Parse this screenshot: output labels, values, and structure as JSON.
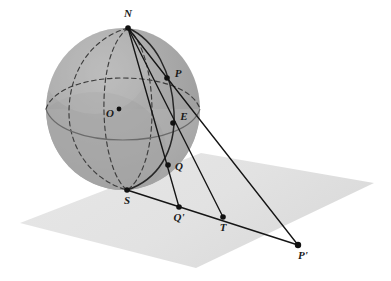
{
  "figure": {
    "name": "stereographic-projection-diagram",
    "title": "",
    "background_color": "#ffffff"
  },
  "colors": {
    "sphere_fill": "#a9a9a9",
    "sphere_lower_band": "#b4b4b4",
    "sphere_shadow": "#9a9a9a",
    "sphere_highlight": "#b8b8b8",
    "plane_fill": "#e5e5e5",
    "plane_fill_dark": "#dcdcdc",
    "line_color": "#1a1a1a",
    "curve_color": "#2b2b2b",
    "dashed_color": "#3a3a3a",
    "label_color": "#1a1a1a",
    "point_color": "#111111"
  },
  "points": [
    {
      "id": "N",
      "label": "N",
      "x": 128,
      "y": 28,
      "label_x": 128,
      "label_y": 14,
      "on": "sphere-north-pole"
    },
    {
      "id": "P",
      "label": "P",
      "x": 167,
      "y": 78,
      "label_x": 178,
      "label_y": 74,
      "on": "sphere"
    },
    {
      "id": "O",
      "label": "O",
      "x": 119,
      "y": 109,
      "label_x": 110,
      "label_y": 114,
      "on": "sphere-center"
    },
    {
      "id": "E",
      "label": "E",
      "x": 173,
      "y": 123,
      "label_x": 184,
      "label_y": 117,
      "on": "sphere-equator"
    },
    {
      "id": "Q",
      "label": "Q",
      "x": 168,
      "y": 165,
      "label_x": 179,
      "label_y": 167,
      "on": "sphere"
    },
    {
      "id": "S",
      "label": "S",
      "x": 127,
      "y": 190,
      "label_x": 127,
      "label_y": 201,
      "on": "sphere-south-pole"
    },
    {
      "id": "Qp",
      "label": "Q'",
      "x": 179,
      "y": 207,
      "label_x": 179,
      "label_y": 218,
      "on": "plane"
    },
    {
      "id": "T",
      "label": "T",
      "x": 223,
      "y": 217,
      "label_x": 223,
      "label_y": 228,
      "on": "plane"
    },
    {
      "id": "Pp",
      "label": "P'",
      "x": 298,
      "y": 245,
      "label_x": 303,
      "label_y": 256,
      "on": "plane"
    }
  ],
  "sphere": {
    "center_x": 123,
    "center_y": 109,
    "radius_x": 77,
    "radius_y": 81
  },
  "plane": {
    "corners": [
      {
        "x": 20,
        "y": 223
      },
      {
        "x": 201,
        "y": 153
      },
      {
        "x": 374,
        "y": 183
      },
      {
        "x": 196,
        "y": 268
      }
    ]
  },
  "segments": [
    {
      "id": "N-P-Pprime",
      "from": "N",
      "to": "P'",
      "style": "solid",
      "description": "projection ray from north pole through P to P-prime"
    },
    {
      "id": "N-Q-Qprime",
      "from": "N",
      "to": "Q'",
      "style": "solid",
      "description": "projection ray from north pole through Q to Q-prime"
    },
    {
      "id": "N-E-T",
      "from": "N",
      "to": "T",
      "style": "solid",
      "description": "projection ray from north pole through E to T"
    },
    {
      "id": "S-Pprime",
      "from": "S",
      "to": "P'",
      "style": "solid",
      "description": "line in the plane from S through Q-prime and T to P-prime"
    }
  ],
  "curves": [
    {
      "id": "great-circle-N-P-E-Q-S",
      "style": "solid",
      "description": "great circle through N, P, E, Q, S"
    },
    {
      "id": "equator",
      "style": "mixed",
      "description": "equator ellipse: front solid, back dashed"
    },
    {
      "id": "hidden-meridian-left",
      "style": "dashed",
      "description": "hidden meridian ellipse on left"
    },
    {
      "id": "hidden-meridian-right",
      "style": "dashed",
      "description": "hidden meridian ellipse on right"
    }
  ],
  "labels": {
    "north_pole": "N",
    "point_p": "P",
    "center": "O",
    "equator_point": "E",
    "point_q": "Q",
    "south_pole": "S",
    "q_prime": "Q'",
    "tangent_point": "T",
    "p_prime": "P'"
  }
}
